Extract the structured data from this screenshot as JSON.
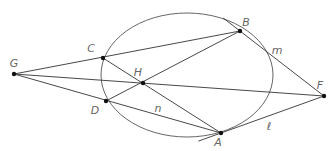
{
  "diagram": {
    "ellipse": {
      "cx": 187,
      "cy": 75,
      "rx": 86,
      "ry": 62
    },
    "points": {
      "G": {
        "label": "G",
        "x": 14,
        "y": 74,
        "lx": 14,
        "ly": 67
      },
      "C": {
        "label": "C",
        "x": 103,
        "y": 58,
        "lx": 91,
        "ly": 52
      },
      "H": {
        "label": "H",
        "x": 143,
        "y": 83,
        "lx": 138,
        "ly": 76
      },
      "D": {
        "label": "D",
        "x": 106,
        "y": 101,
        "lx": 95,
        "ly": 114
      },
      "B": {
        "label": "B",
        "x": 240,
        "y": 31,
        "lx": 246,
        "ly": 26
      },
      "F": {
        "label": "F",
        "x": 324,
        "y": 96,
        "lx": 320,
        "ly": 89
      },
      "A": {
        "label": "A",
        "x": 221,
        "y": 133,
        "lx": 218,
        "ly": 146
      }
    },
    "line_labels": {
      "m": {
        "text": "m",
        "x": 277,
        "y": 54
      },
      "n": {
        "text": "n",
        "x": 158,
        "y": 112
      },
      "l": {
        "text": "ℓ",
        "x": 269,
        "y": 130
      }
    },
    "colors": {
      "line": "#333333",
      "point": "#111111",
      "label": "#666666"
    }
  }
}
